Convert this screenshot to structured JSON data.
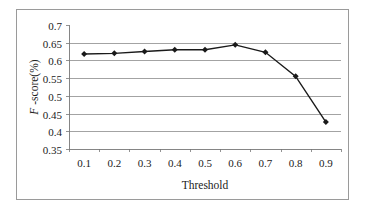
{
  "chart_data": {
    "type": "line",
    "title": "",
    "xlabel": "Threshold",
    "ylabel_italic": "F",
    "ylabel_rest": " -score(%)",
    "ylabel": "F -score(%)",
    "categories": [
      "0.1",
      "0.2",
      "0.3",
      "0.4",
      "0.5",
      "0.6",
      "0.7",
      "0.8",
      "0.9"
    ],
    "series": [
      {
        "name": "F-score",
        "values": [
          0.618,
          0.62,
          0.625,
          0.63,
          0.63,
          0.644,
          0.623,
          0.555,
          0.426
        ],
        "color": "#1a1a1a",
        "marker": "diamond"
      }
    ],
    "ylim": [
      0.35,
      0.7
    ],
    "yticks": [
      "0.35",
      "0.4",
      "0.45",
      "0.5",
      "0.55",
      "0.6",
      "0.65",
      "0.7"
    ],
    "grid": true,
    "legend": "none"
  }
}
